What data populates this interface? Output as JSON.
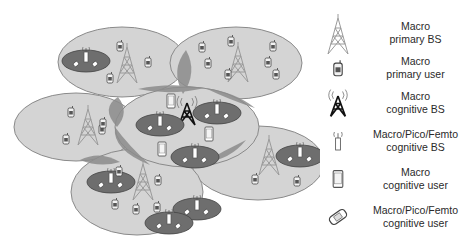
{
  "colors": {
    "cell_fill": "#d4d4d4",
    "cell_stroke": "#8a8a8a",
    "overlap_fill": "#8c8c8c",
    "small_cell_fill": "#6e6e6e",
    "macro_primary_bs": "#9a9a9a",
    "macro_cognitive_bs": "#111111",
    "text": "#2a2a2a"
  },
  "legend": [
    {
      "icon": "macro-primary-bs-icon",
      "line1": "Macro",
      "line2": "primary BS"
    },
    {
      "icon": "macro-primary-user-icon",
      "line1": "Macro",
      "line2": "primary user"
    },
    {
      "icon": "macro-cognitive-bs-icon",
      "line1": "Macro",
      "line2": "cognitive BS"
    },
    {
      "icon": "small-cell-cognitive-bs-icon",
      "line1": "Macro/Pico/Femto",
      "line2": "cognitive BS"
    },
    {
      "icon": "macro-cognitive-user-icon",
      "line1": "Macro",
      "line2": "cognitive user"
    },
    {
      "icon": "small-cell-cognitive-user-icon",
      "line1": "Macro/Pico/Femto",
      "line2": "cognitive user"
    }
  ]
}
